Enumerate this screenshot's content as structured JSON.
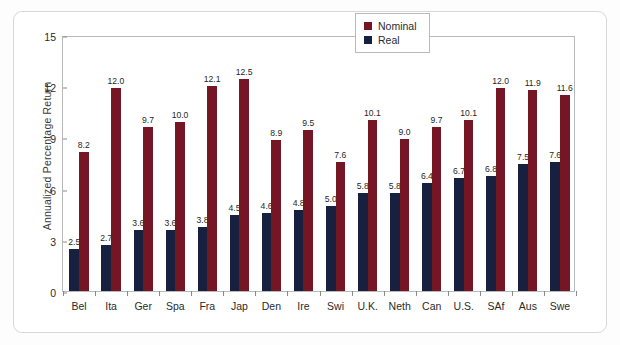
{
  "chart_data": {
    "type": "bar",
    "title": "",
    "xlabel": "",
    "ylabel": "Annualized Percentage Return",
    "ylim": [
      0,
      15
    ],
    "yticks": [
      "0",
      "3",
      "6",
      "9",
      "12",
      "15"
    ],
    "grid": false,
    "legend_position": "top-right",
    "categories": [
      "Bel",
      "Ita",
      "Ger",
      "Spa",
      "Fra",
      "Jap",
      "Den",
      "Ire",
      "Swi",
      "U.K.",
      "Neth",
      "Can",
      "U.S.",
      "SAf",
      "Aus",
      "Swe"
    ],
    "series": [
      {
        "name": "Real",
        "color": "#17213f",
        "values": [
          2.5,
          2.7,
          3.6,
          3.6,
          3.8,
          4.5,
          4.6,
          4.8,
          5.0,
          5.8,
          5.8,
          6.4,
          6.7,
          6.8,
          7.5,
          7.6
        ],
        "labels": [
          "2.5",
          "2.7",
          "3.6",
          "3.6",
          "3.8",
          "4.5",
          "4.6",
          "4.8",
          "5.0",
          "5.8",
          "5.8",
          "6.4",
          "6.7",
          "6.8",
          "7.5",
          "7.6"
        ]
      },
      {
        "name": "Nominal",
        "color": "#751624",
        "values": [
          8.2,
          12.0,
          9.7,
          10.0,
          12.1,
          12.5,
          8.9,
          9.5,
          7.6,
          10.1,
          9.0,
          9.7,
          10.1,
          12.0,
          11.9,
          11.6
        ],
        "labels": [
          "8.2",
          "12.0",
          "9.7",
          "10.0",
          "12.1",
          "12.5",
          "8.9",
          "9.5",
          "7.6",
          "10.1",
          "9.0",
          "9.7",
          "10.1",
          "12.0",
          "11.9",
          "11.6"
        ]
      }
    ],
    "legend": [
      {
        "label": "Nominal",
        "color": "#751624"
      },
      {
        "label": "Real",
        "color": "#17213f"
      }
    ]
  }
}
